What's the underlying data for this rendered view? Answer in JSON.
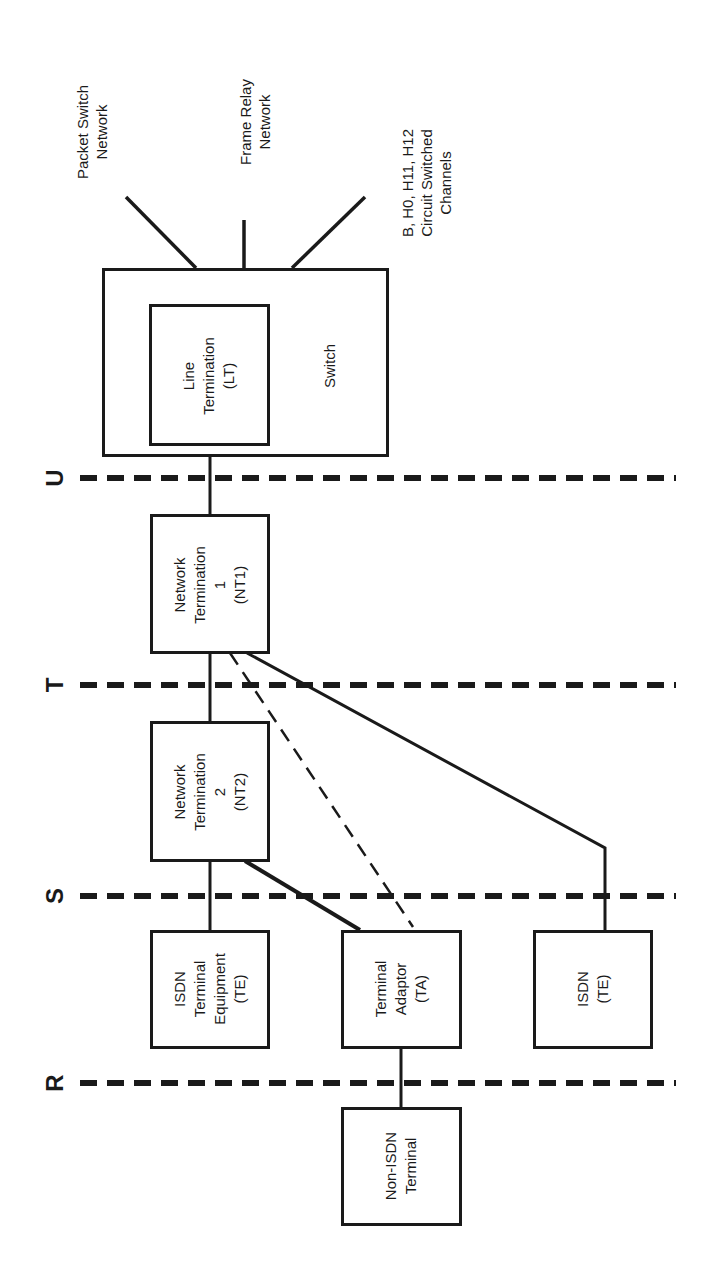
{
  "diagram": {
    "type": "ISDN reference configuration",
    "orientation": "rotated 90deg counter-clockwise",
    "reference_points": [
      {
        "id": "U",
        "label": "U"
      },
      {
        "id": "T",
        "label": "T"
      },
      {
        "id": "S",
        "label": "S"
      },
      {
        "id": "R",
        "label": "R"
      }
    ],
    "external_networks": [
      {
        "id": "packet",
        "label": "Packet Switch\nNetwork"
      },
      {
        "id": "frame",
        "label": "Frame Relay\nNetwork"
      },
      {
        "id": "circuit",
        "label": "B, H0, H11, H12\nCircuit Switched\nChannels"
      }
    ],
    "nodes": {
      "switch": {
        "label": "Switch"
      },
      "lt": {
        "label": "Line\nTermination\n(LT)"
      },
      "nt1": {
        "label": "Network\nTermination\n1\n(NT1)"
      },
      "nt2": {
        "label": "Network\nTermination\n2\n(NT2)"
      },
      "te1": {
        "label": "ISDN\nTerminal\nEquipment\n(TE)"
      },
      "ta": {
        "label": "Terminal\nAdaptor\n(TA)"
      },
      "te2": {
        "label": "ISDN\n(TE)"
      },
      "non_isdn": {
        "label": "Non-ISDN\nTerminal"
      }
    },
    "edges": [
      {
        "from": "switch",
        "to": "packet",
        "style": "solid"
      },
      {
        "from": "switch",
        "to": "frame",
        "style": "solid"
      },
      {
        "from": "switch",
        "to": "circuit",
        "style": "solid"
      },
      {
        "from": "lt",
        "to": "nt1",
        "style": "solid",
        "crosses": "U"
      },
      {
        "from": "nt1",
        "to": "nt2",
        "style": "solid",
        "crosses": "T"
      },
      {
        "from": "nt1",
        "to": "ta",
        "style": "dashed",
        "crosses": "T,S"
      },
      {
        "from": "nt1",
        "to": "te2",
        "style": "solid",
        "crosses": "T,S"
      },
      {
        "from": "nt2",
        "to": "te1",
        "style": "solid",
        "crosses": "S"
      },
      {
        "from": "nt2",
        "to": "ta",
        "style": "solid",
        "crosses": "S"
      },
      {
        "from": "ta",
        "to": "non_isdn",
        "style": "solid",
        "crosses": "R"
      }
    ],
    "colors": {
      "ink": "#1a1a1a",
      "background": "#ffffff"
    }
  }
}
